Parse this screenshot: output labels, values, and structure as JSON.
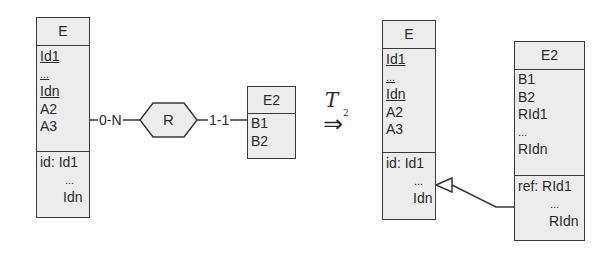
{
  "left_schema": {
    "entity_e": {
      "name": "E",
      "attributes": [
        {
          "text": "Id1",
          "underlined": true
        },
        {
          "text": "...",
          "underlined": true
        },
        {
          "text": "Idn",
          "underlined": true
        },
        {
          "text": "A2",
          "underlined": false
        },
        {
          "text": "A3",
          "underlined": false
        }
      ],
      "constraints": [
        "id: Id1",
        "...",
        "Idn"
      ]
    },
    "relationship": {
      "name": "R",
      "left_cardinality": "0-N",
      "right_cardinality": "1-1"
    },
    "entity_e2": {
      "name": "E2",
      "attributes": [
        "B1",
        "B2"
      ]
    }
  },
  "transformation": {
    "symbol": "T",
    "subscript": "2",
    "arrow": "⇒"
  },
  "right_schema": {
    "entity_e": {
      "name": "E",
      "attributes": [
        {
          "text": "Id1",
          "underlined": true
        },
        {
          "text": "...",
          "underlined": true
        },
        {
          "text": "Idn",
          "underlined": true
        },
        {
          "text": "A2",
          "underlined": false
        },
        {
          "text": "A3",
          "underlined": false
        }
      ],
      "constraints": [
        "id: Id1",
        "...",
        "Idn"
      ]
    },
    "entity_e2": {
      "name": "E2",
      "attributes": [
        "B1",
        "B2",
        "RId1",
        "...",
        "RIdn"
      ],
      "constraints": [
        "ref: RId1",
        "...",
        "RIdn"
      ]
    }
  },
  "colors": {
    "box_fill": "#ececec",
    "line": "#3a3a3a",
    "background": "#ffffff"
  }
}
